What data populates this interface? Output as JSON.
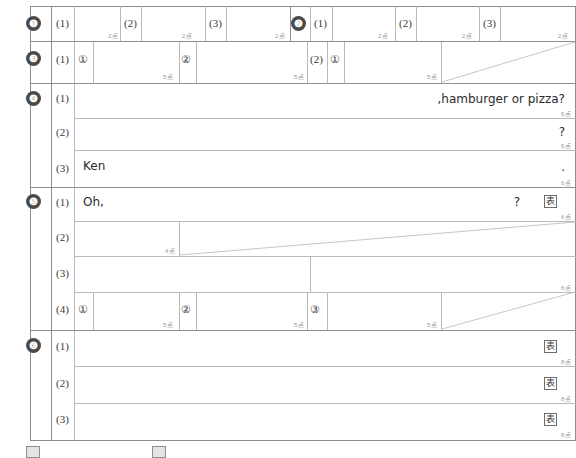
{
  "sheet": {
    "title": "英語 解答用紙",
    "point_suffix": "点",
    "category_glyph": "表"
  },
  "questions": [
    {
      "number": "1",
      "badge": "❶",
      "subs": [
        {
          "label": "(1)",
          "points": "2点"
        },
        {
          "label": "(2)",
          "points": "2点"
        },
        {
          "label": "(3)",
          "points": "2点"
        }
      ]
    },
    {
      "number": "2",
      "badge": "❷",
      "subs": [
        {
          "label": "(1)",
          "points": "2点"
        },
        {
          "label": "(2)",
          "points": "2点"
        },
        {
          "label": "(3)",
          "points": "2点"
        }
      ]
    },
    {
      "number": "3",
      "badge": "❸",
      "subs": [
        {
          "label": "(1)",
          "items": [
            {
              "mark": "①",
              "points": "5点"
            },
            {
              "mark": "②",
              "points": "5点"
            }
          ]
        },
        {
          "label": "(2)",
          "items": [
            {
              "mark": "①",
              "points": "5点"
            }
          ]
        }
      ]
    },
    {
      "number": "4",
      "badge": "❹",
      "subs": [
        {
          "label": "(1)",
          "answer_left": "",
          "answer_right": ",hamburger or pizza?",
          "points": "6点"
        },
        {
          "label": "(2)",
          "answer_left": "",
          "answer_right": "?",
          "points": "6点"
        },
        {
          "label": "(3)",
          "answer_left": "Ken",
          "answer_right": ".",
          "points": "6点"
        }
      ]
    },
    {
      "number": "5",
      "badge": "❺",
      "subs": [
        {
          "label": "(1)",
          "answer_left": "Oh,",
          "answer_right": "?",
          "points": "6点",
          "category": "表"
        },
        {
          "label": "(2)",
          "points": "4点"
        },
        {
          "label": "(3)",
          "points": "6点"
        },
        {
          "label": "(4)",
          "items": [
            {
              "mark": "①",
              "points": "5点"
            },
            {
              "mark": "②",
              "points": "5点"
            },
            {
              "mark": "③",
              "points": "5点"
            }
          ]
        }
      ]
    },
    {
      "number": "6",
      "badge": "❻",
      "subs": [
        {
          "label": "(1)",
          "points": "8点",
          "category": "表"
        },
        {
          "label": "(2)",
          "points": "8点",
          "category": "表"
        },
        {
          "label": "(3)",
          "points": "8点",
          "category": "表"
        }
      ]
    }
  ],
  "legend": {
    "items": [
      {
        "glyph": ""
      },
      {
        "glyph": ""
      }
    ]
  }
}
